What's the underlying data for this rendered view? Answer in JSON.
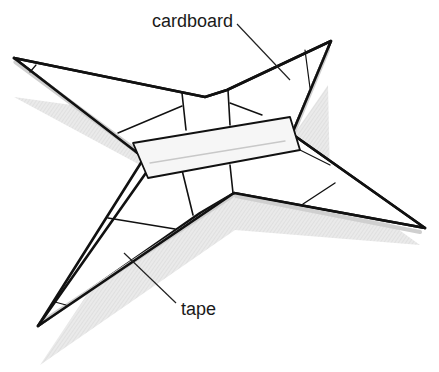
{
  "diagram": {
    "labels": [
      {
        "id": "cardboard",
        "text": "cardboard"
      },
      {
        "id": "tape",
        "text": "tape"
      }
    ],
    "colors": {
      "outline": "#111111",
      "fill": "#ffffff",
      "tape_edge": "#d4d4d4",
      "shadow": "#dcdcdc"
    }
  }
}
